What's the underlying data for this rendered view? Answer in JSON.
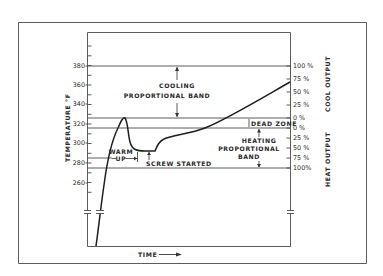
{
  "chart_data": {
    "type": "line",
    "title": "",
    "xlabel": "TIME",
    "ylabel": "TEMPERATURE °F",
    "y_ticks": [
      260,
      280,
      300,
      320,
      340,
      360,
      380
    ],
    "ylim": [
      220,
      400
    ],
    "grid": false,
    "right_axis": {
      "cool_output_label": "COOL OUTPUT",
      "heat_output_label": "HEAT OUTPUT",
      "cool_ticks": [
        "100 %",
        "75 %",
        "50 %",
        "25 %",
        "0 %"
      ],
      "heat_ticks": [
        "0 %",
        "25 %",
        "50 %",
        "75 %",
        "100%"
      ]
    },
    "reference_lines_F": [
      {
        "value": 380,
        "label": "100% cool output"
      },
      {
        "value": 325,
        "label": "0% cool output (top of dead zone)"
      },
      {
        "value": 315,
        "label": "0% heat output (bottom of dead zone)"
      },
      {
        "value": 285,
        "label": "warm-up / screw started marker"
      },
      {
        "value": 275,
        "label": "100% heat output"
      }
    ],
    "bands": [
      {
        "name": "COOLING PROPORTIONAL BAND",
        "from": 325,
        "to": 380
      },
      {
        "name": "DEAD ZONE",
        "from": 315,
        "to": 325
      },
      {
        "name": "HEATING PROPORTIONAL BAND",
        "from": 275,
        "to": 315
      }
    ],
    "annotations": [
      "WARM UP",
      "SCREW STARTED"
    ],
    "series": [
      {
        "name": "Temperature",
        "x_relative": [
          0.0,
          0.03,
          0.07,
          0.11,
          0.14,
          0.17,
          0.2,
          0.25,
          0.27,
          0.32,
          0.45,
          0.6,
          0.8,
          1.0
        ],
        "values": [
          225,
          260,
          290,
          315,
          326,
          305,
          292,
          292,
          298,
          302,
          310,
          325,
          345,
          362
        ]
      }
    ]
  },
  "labels": {
    "y_axis": "TEMPERATURE °F",
    "x_axis": "TIME",
    "cooling_band_line1": "COOLING",
    "cooling_band_line2": "PROPORTIONAL BAND",
    "dead_zone": "DEAD ZONE",
    "heating_band_line1": "HEATING",
    "heating_band_line2": "PROPORTIONAL",
    "heating_band_line3": "BAND",
    "warm_line1": "WARM",
    "warm_line2": "UP",
    "screw_started": "SCREW STARTED",
    "cool_output": "COOL OUTPUT",
    "heat_output": "HEAT OUTPUT"
  },
  "y_ticks": [
    {
      "label": "380",
      "y": 66
    },
    {
      "label": "360",
      "y": 85
    },
    {
      "label": "340",
      "y": 104
    },
    {
      "label": "320",
      "y": 124
    },
    {
      "label": "300",
      "y": 143
    },
    {
      "label": "280",
      "y": 163
    },
    {
      "label": "260",
      "y": 183
    }
  ],
  "right_ticks": [
    {
      "label": "100 %",
      "y": 66
    },
    {
      "label": "75 %",
      "y": 79
    },
    {
      "label": "50 %",
      "y": 92
    },
    {
      "label": "25 %",
      "y": 105
    },
    {
      "label": "0 %",
      "y": 118
    },
    {
      "label": "0 %",
      "y": 128
    },
    {
      "label": "25 %",
      "y": 138
    },
    {
      "label": "50 %",
      "y": 148
    },
    {
      "label": "75 %",
      "y": 158
    },
    {
      "label": "100%",
      "y": 168
    }
  ]
}
